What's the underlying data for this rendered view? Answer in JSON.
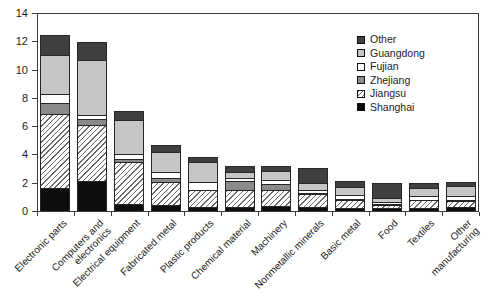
{
  "chart_data": {
    "type": "bar",
    "stacked": true,
    "title": "",
    "xlabel": "",
    "ylabel": "",
    "grid": false,
    "y_axis": {
      "min": 0,
      "max": 14,
      "tick_step": 2,
      "ticks": [
        0,
        2,
        4,
        6,
        8,
        10,
        12,
        14
      ]
    },
    "categories": [
      "Electronic parts",
      "Computers and\nelectronics",
      "Electrical equipment",
      "Fabricated metal",
      "Plastic products",
      "Chemical material",
      "Machinery",
      "Nonmetallic minerals",
      "Basic metal",
      "Food",
      "Textiles",
      "Other\nmanufacturing"
    ],
    "series": [
      {
        "name": "Shanghai",
        "key": "shanghai",
        "color": "#0c0c0c",
        "pattern": "solid",
        "values": [
          1.6,
          2.1,
          0.5,
          0.4,
          0.3,
          0.3,
          0.35,
          0.3,
          0.2,
          0.2,
          0.2,
          0.25
        ]
      },
      {
        "name": "Jiangsu",
        "key": "jiangsu",
        "color": "#ffffff",
        "pattern": "diagonal-hatch",
        "values": [
          5.25,
          4.0,
          2.95,
          1.65,
          1.15,
          1.2,
          1.15,
          0.9,
          0.6,
          0.2,
          0.55,
          0.45
        ]
      },
      {
        "name": "Zhejiang",
        "key": "zhejiang",
        "color": "#8a8a8a",
        "pattern": "solid",
        "values": [
          0.8,
          0.4,
          0.25,
          0.3,
          0.05,
          0.6,
          0.4,
          0.05,
          0.05,
          0.1,
          0.05,
          0.05
        ]
      },
      {
        "name": "Fujian",
        "key": "fujian",
        "color": "#ffffff",
        "pattern": "solid",
        "values": [
          0.65,
          0.3,
          0.35,
          0.4,
          0.55,
          0.25,
          0.3,
          0.25,
          0.3,
          0.15,
          0.25,
          0.3
        ]
      },
      {
        "name": "Guangdong",
        "key": "guangdong",
        "color": "#c6c6c6",
        "pattern": "solid",
        "values": [
          2.75,
          3.9,
          2.4,
          1.4,
          1.4,
          0.4,
          0.6,
          0.45,
          0.55,
          0.3,
          0.6,
          0.75
        ]
      },
      {
        "name": "Other",
        "key": "other",
        "color": "#404040",
        "pattern": "solid",
        "values": [
          1.4,
          1.25,
          0.65,
          0.5,
          0.35,
          0.4,
          0.4,
          1.1,
          0.45,
          1.05,
          0.35,
          0.25
        ]
      }
    ],
    "totals": [
      12.45,
      11.95,
      7.1,
      4.65,
      3.8,
      3.15,
      3.2,
      3.05,
      2.15,
      2.0,
      2.0,
      2.05
    ],
    "legend": {
      "position": "top-right",
      "order": [
        "Other",
        "Guangdong",
        "Fujian",
        "Zhejiang",
        "Jiangsu",
        "Shanghai"
      ]
    }
  }
}
